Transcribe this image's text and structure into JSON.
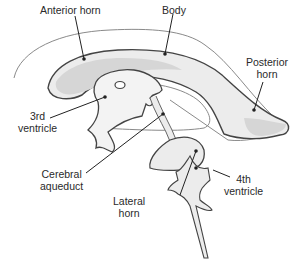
{
  "diagram": {
    "colors": {
      "fill_light": "#ececec",
      "fill_dark": "#d6d6d6",
      "outline": "#444444",
      "thin_outline": "#8a8a8a",
      "leader": "#222222"
    },
    "labels": [
      {
        "id": "anterior-horn",
        "line1": "Anterior horn",
        "line2": ""
      },
      {
        "id": "body",
        "line1": "Body",
        "line2": ""
      },
      {
        "id": "posterior-horn",
        "line1": "Posterior",
        "line2": "horn"
      },
      {
        "id": "third-ventricle",
        "line1": "3rd",
        "line2": "ventricle"
      },
      {
        "id": "cerebral-aqueduct",
        "line1": "Cerebral",
        "line2": "aqueduct"
      },
      {
        "id": "lateral-horn",
        "line1": "Lateral",
        "line2": "horn"
      },
      {
        "id": "fourth-ventricle",
        "line1": "4th",
        "line2": "ventricle"
      }
    ]
  }
}
